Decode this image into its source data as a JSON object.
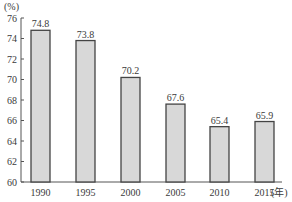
{
  "chart_data": {
    "type": "bar",
    "title": "",
    "xlabel": "(年)",
    "ylabel": "(%)",
    "categories": [
      "1990",
      "1995",
      "2000",
      "2005",
      "2010",
      "2015"
    ],
    "values": [
      74.8,
      73.8,
      70.2,
      67.6,
      65.4,
      65.9
    ],
    "data_labels": [
      "74.8",
      "73.8",
      "70.2",
      "67.6",
      "65.4",
      "65.9"
    ],
    "ylim": [
      60,
      76
    ],
    "yticks": [
      60,
      62,
      64,
      66,
      68,
      70,
      72,
      74,
      76
    ],
    "grid": false,
    "legend": null,
    "bar_color": "#d8d8d8",
    "bar_edge_color": "#444444"
  }
}
